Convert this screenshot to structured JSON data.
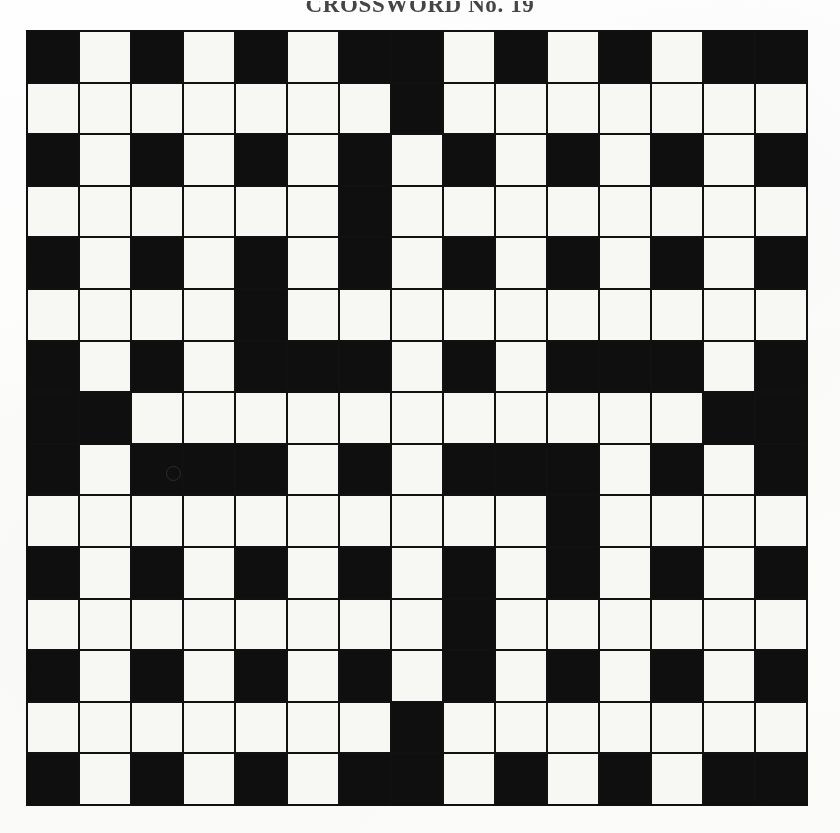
{
  "document": {
    "title": "CROSSWORD No. 19",
    "type": "crossword-grid"
  },
  "grid": {
    "rows": 15,
    "cols": 15,
    "cell_size_px": 52,
    "block_color": "#100f0f",
    "open_color": "#f7f7f4",
    "border_color": "#111111",
    "legend": {
      "1": "block",
      "0": "open"
    },
    "cells": [
      [
        1,
        0,
        1,
        0,
        1,
        0,
        1,
        1,
        0,
        1,
        0,
        1,
        0,
        1,
        1
      ],
      [
        0,
        0,
        0,
        0,
        0,
        0,
        0,
        1,
        0,
        0,
        0,
        0,
        0,
        0,
        0
      ],
      [
        1,
        0,
        1,
        0,
        1,
        0,
        1,
        0,
        1,
        0,
        1,
        0,
        1,
        0,
        1
      ],
      [
        0,
        0,
        0,
        0,
        0,
        0,
        1,
        0,
        0,
        0,
        0,
        0,
        0,
        0,
        0
      ],
      [
        1,
        0,
        1,
        0,
        1,
        0,
        1,
        0,
        1,
        0,
        1,
        0,
        1,
        0,
        1
      ],
      [
        0,
        0,
        0,
        0,
        1,
        0,
        0,
        0,
        0,
        0,
        0,
        0,
        0,
        0,
        0
      ],
      [
        1,
        0,
        1,
        0,
        1,
        1,
        1,
        0,
        1,
        0,
        1,
        1,
        1,
        0,
        1
      ],
      [
        1,
        1,
        0,
        0,
        0,
        0,
        0,
        0,
        0,
        0,
        0,
        0,
        0,
        1,
        1
      ],
      [
        1,
        0,
        1,
        1,
        1,
        0,
        1,
        0,
        1,
        1,
        1,
        0,
        1,
        0,
        1
      ],
      [
        0,
        0,
        0,
        0,
        0,
        0,
        0,
        0,
        0,
        0,
        1,
        0,
        0,
        0,
        0
      ],
      [
        1,
        0,
        1,
        0,
        1,
        0,
        1,
        0,
        1,
        0,
        1,
        0,
        1,
        0,
        1
      ],
      [
        0,
        0,
        0,
        0,
        0,
        0,
        0,
        0,
        1,
        0,
        0,
        0,
        0,
        0,
        0
      ],
      [
        1,
        0,
        1,
        0,
        1,
        0,
        1,
        0,
        1,
        0,
        1,
        0,
        1,
        0,
        1
      ],
      [
        0,
        0,
        0,
        0,
        0,
        0,
        0,
        1,
        0,
        0,
        0,
        0,
        0,
        0,
        0
      ],
      [
        1,
        0,
        1,
        0,
        1,
        0,
        1,
        1,
        0,
        1,
        0,
        1,
        0,
        1,
        1
      ]
    ]
  },
  "artifacts": {
    "speck": {
      "x": 166,
      "y": 466
    }
  }
}
